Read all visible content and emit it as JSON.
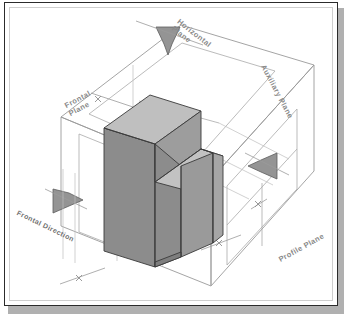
{
  "figure": {
    "type": "technical-isometric-projection-diagram",
    "background_color": "#ffffff",
    "frame_color": "#2b2b2b",
    "shadow_color": "#b0b0b0"
  },
  "labels": {
    "horizontal_plane": {
      "line1": "Horizontal",
      "line2": "Plane"
    },
    "auxiliary_plane": {
      "text": "Auxiliary Plane"
    },
    "frontal_plane": {
      "line1": "Frontal",
      "line2": "Plane"
    },
    "profile_plane": {
      "text": "Profile  Plane"
    },
    "frontal_direction": {
      "text": "Frontal Direction"
    }
  },
  "arrows": [
    {
      "name": "horizontal-view-arrow",
      "direction": "down",
      "x": 163,
      "y": 30,
      "color": "#8c8c8c"
    },
    {
      "name": "profile-view-arrow",
      "direction": "left",
      "x": 258,
      "y": 163,
      "color": "#8c8c8c"
    },
    {
      "name": "frontal-view-arrow",
      "direction": "right",
      "x": 62,
      "y": 197,
      "color": "#8c8c8c"
    }
  ],
  "solid": {
    "name": "stepped-block",
    "face_colors": {
      "front_dark": "#8b8b8b",
      "side_mid": "#9a9a9a",
      "top_light": "#bcbcbc",
      "right_light": "#a8a8a8",
      "edge": "#3a3a3a"
    }
  },
  "planes": {
    "line_color": "#9a9a9a",
    "projection_line_color": "#b5b5b5",
    "dimension_tick": "×",
    "tick_count": 4
  },
  "colors": {
    "accent": "#8c8c8c",
    "text": "#8a8a8a",
    "outline": "#2b2b2b"
  }
}
